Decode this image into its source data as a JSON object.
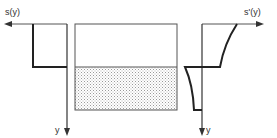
{
  "left_plot": {
    "axis_label_horizontal": "s(y)",
    "axis_label_vertical": "y"
  },
  "right_plot": {
    "axis_label_horizontal": "s'(y)",
    "axis_label_vertical": "y"
  },
  "center_box": {
    "upper_region": "blank",
    "lower_region": "stippled"
  },
  "colors": {
    "line": "#333333",
    "stipple": "#bfbfbf",
    "background": "#ffffff"
  }
}
